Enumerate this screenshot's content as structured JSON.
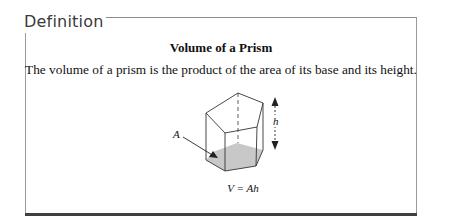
{
  "box": {
    "heading": "Definition",
    "title": "Volume of a Prism",
    "body": "The volume of a prism is the product of the area of its base and its height."
  },
  "figure": {
    "base_label": "A",
    "height_label": "h",
    "formula": "V = Ah",
    "base_fill": "#c8c8c8",
    "edge_color": "#333333"
  }
}
